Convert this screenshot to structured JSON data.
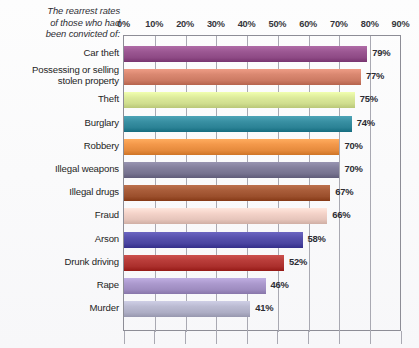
{
  "chart_data": {
    "type": "bar",
    "orientation": "horizontal",
    "xlabel": "",
    "ylabel": "",
    "xlim": [
      0,
      90
    ],
    "grid": true,
    "legend": "none",
    "xticks": [
      "0%",
      "10%",
      "20%",
      "30%",
      "40%",
      "50%",
      "60%",
      "70%",
      "80%",
      "90%"
    ],
    "xtick_values": [
      0,
      10,
      20,
      30,
      40,
      50,
      60,
      70,
      80,
      90
    ],
    "categories": [
      "Car theft",
      "Possessing or selling stolen property",
      "Theft",
      "Burglary",
      "Robbery",
      "Illegal weapons",
      "Illegal drugs",
      "Fraud",
      "Arson",
      "Drunk driving",
      "Rape",
      "Murder"
    ],
    "values": [
      79,
      77,
      75,
      74,
      70,
      70,
      67,
      66,
      58,
      52,
      46,
      41
    ],
    "value_labels": [
      "79%",
      "77%",
      "75%",
      "74%",
      "70%",
      "70%",
      "67%",
      "66%",
      "58%",
      "52%",
      "46%",
      "41%"
    ],
    "colors": [
      "#8e4a85",
      "#cc7a63",
      "#cfdd8e",
      "#2b8295",
      "#e58a3c",
      "#76728f",
      "#9b4f2c",
      "#e6c5bb",
      "#4a44a0",
      "#ab2f2c",
      "#9e8cc0",
      "#adadc4"
    ]
  },
  "title_lines": [
    "The rearrest rates",
    "of those who had",
    "been convicted of:"
  ],
  "category_lines": [
    [
      "Car theft"
    ],
    [
      "Possessing or selling",
      "stolen property"
    ],
    [
      "Theft"
    ],
    [
      "Burglary"
    ],
    [
      "Robbery"
    ],
    [
      "Illegal weapons"
    ],
    [
      "Illegal drugs"
    ],
    [
      "Fraud"
    ],
    [
      "Arson"
    ],
    [
      "Drunk driving"
    ],
    [
      "Rape"
    ],
    [
      "Murder"
    ]
  ]
}
